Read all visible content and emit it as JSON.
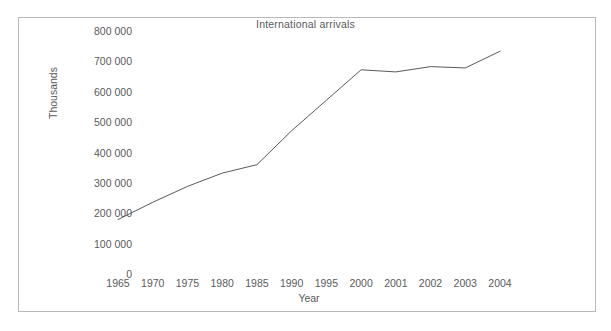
{
  "chart_data": {
    "type": "line",
    "title": "International arrivals",
    "xlabel": "Year",
    "ylabel": "Thousands",
    "categories": [
      "1965",
      "1970",
      "1975",
      "1980",
      "1985",
      "1990",
      "1995",
      "2000",
      "2001",
      "2002",
      "2003",
      "2004"
    ],
    "values": [
      115000,
      180000,
      240000,
      290000,
      322000,
      450000,
      565000,
      680000,
      672000,
      692000,
      687000,
      750000
    ],
    "series": [
      {
        "name": "International arrivals",
        "values": [
          115000,
          180000,
          240000,
          290000,
          322000,
          450000,
          565000,
          680000,
          672000,
          692000,
          687000,
          750000
        ]
      }
    ],
    "ylim": [
      0,
      800000
    ],
    "ytick_labels": [
      "0",
      "100 000",
      "200 000",
      "300 000",
      "400 000",
      "500 000",
      "600 000",
      "700 000",
      "800 000"
    ],
    "ytick_values": [
      0,
      100000,
      200000,
      300000,
      400000,
      500000,
      600000,
      700000,
      800000
    ],
    "grid": false,
    "legend": "none",
    "line_color": "#5a5a5a",
    "frame_color": "#b9b9b9",
    "text_color": "#5a5a5a",
    "background_color": "#ffffff"
  }
}
